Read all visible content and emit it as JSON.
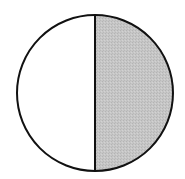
{
  "diagram": {
    "type": "fraction-circle",
    "parts_total": 2,
    "parts_shaded": 1,
    "shaded_side": "right",
    "geometry": {
      "cx": 95,
      "cy": 93,
      "r": 78
    },
    "colors": {
      "background": "#ffffff",
      "unshaded_fill": "#ffffff",
      "shaded_fill": "#c4c4c4",
      "stroke": "#111111"
    },
    "stroke_width": 2
  }
}
